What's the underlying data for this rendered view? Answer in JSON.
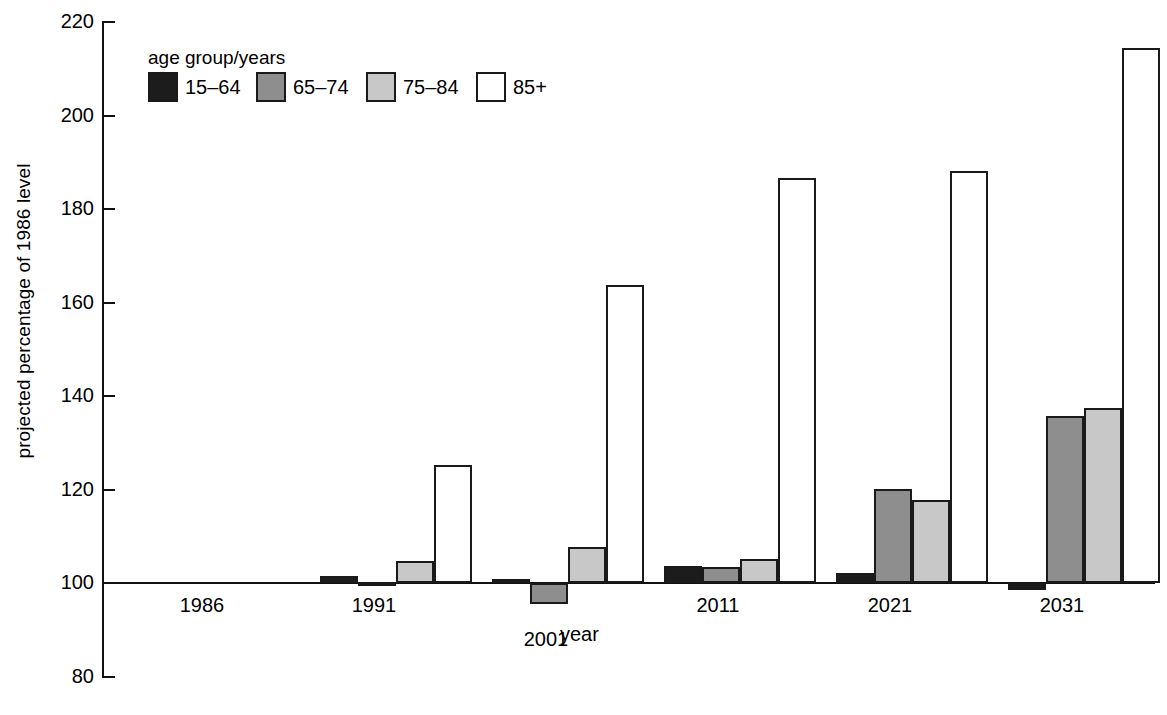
{
  "chart_data": {
    "type": "bar",
    "title": "",
    "xlabel": "year",
    "ylabel": "projected percentage of 1986 level",
    "ylim": [
      80,
      220
    ],
    "yticks": [
      80,
      100,
      120,
      140,
      160,
      180,
      200,
      220
    ],
    "ytick_labels": [
      "80",
      "100",
      "120",
      "140",
      "160",
      "180",
      "200",
      "220"
    ],
    "grid": false,
    "baseline": 100,
    "legend_title": "age group/years",
    "legend_position": "top-left-inside",
    "categories": [
      "1986",
      "1991",
      "2001",
      "2011",
      "2021",
      "2031"
    ],
    "series": [
      {
        "name": "15–64",
        "color": "#1c1c1c",
        "values": [
          100,
          101.5,
          100.9,
          103.6,
          102.1,
          98.5
        ]
      },
      {
        "name": "65–74",
        "color": "#8e8e8e",
        "values": [
          100,
          100.3,
          95.6,
          103.5,
          120.1,
          135.7
        ]
      },
      {
        "name": "75–84",
        "color": "#c8c8c8",
        "values": [
          100,
          104.6,
          107.8,
          105.1,
          117.8,
          137.4
        ]
      },
      {
        "name": "85+",
        "color": "#ffffff",
        "values": [
          100,
          125.2,
          163.8,
          186.7,
          188.2,
          214.5
        ]
      }
    ]
  },
  "axis": {
    "y_title": "projected percentage of 1986 level",
    "x_title": "year",
    "y_ticks": [
      "220",
      "200",
      "180",
      "160",
      "140",
      "120",
      "100",
      "80"
    ],
    "x_ticks": [
      "1986",
      "1991",
      "2001",
      "2011",
      "2021",
      "2031"
    ]
  },
  "legend": {
    "title": "age group/years",
    "items": [
      {
        "label": "15–64",
        "swatch": "swatch-15-64"
      },
      {
        "label": "65–74",
        "swatch": "swatch-65-74"
      },
      {
        "label": "75–84",
        "swatch": "swatch-75-84"
      },
      {
        "label": "85+",
        "swatch": "swatch-85-plus"
      }
    ]
  },
  "colors": {
    "series_15_64": "#1c1c1c",
    "series_65_74": "#8e8e8e",
    "series_75_84": "#c8c8c8",
    "series_85_plus": "#ffffff",
    "axis": "#111111"
  }
}
